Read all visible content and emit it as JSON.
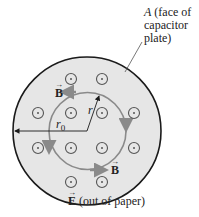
{
  "diagram": {
    "plate_label": {
      "symbol": "A",
      "lines": [
        " (face of",
        "capacitor",
        "plate)"
      ]
    },
    "b_label_top": "B",
    "b_label_bottom": "B",
    "r_label": "r",
    "r0_label": "r",
    "r0_subscript": "0",
    "e_label": {
      "symbol": "E",
      "text": " (out of paper)"
    },
    "colors": {
      "plate_fill": "#e6e6e6",
      "plate_stroke": "#1a1a1a",
      "field_loop": "#8a8a8a",
      "dot_symbol": "#555555",
      "text": "#222222"
    },
    "e_field_symbols": [
      {
        "x": 71,
        "y": 79
      },
      {
        "x": 102,
        "y": 79
      },
      {
        "x": 38,
        "y": 113
      },
      {
        "x": 71,
        "y": 113
      },
      {
        "x": 102,
        "y": 113
      },
      {
        "x": 134,
        "y": 113
      },
      {
        "x": 38,
        "y": 148
      },
      {
        "x": 71,
        "y": 148
      },
      {
        "x": 102,
        "y": 148
      },
      {
        "x": 134,
        "y": 148
      },
      {
        "x": 71,
        "y": 182
      },
      {
        "x": 102,
        "y": 182
      }
    ]
  }
}
